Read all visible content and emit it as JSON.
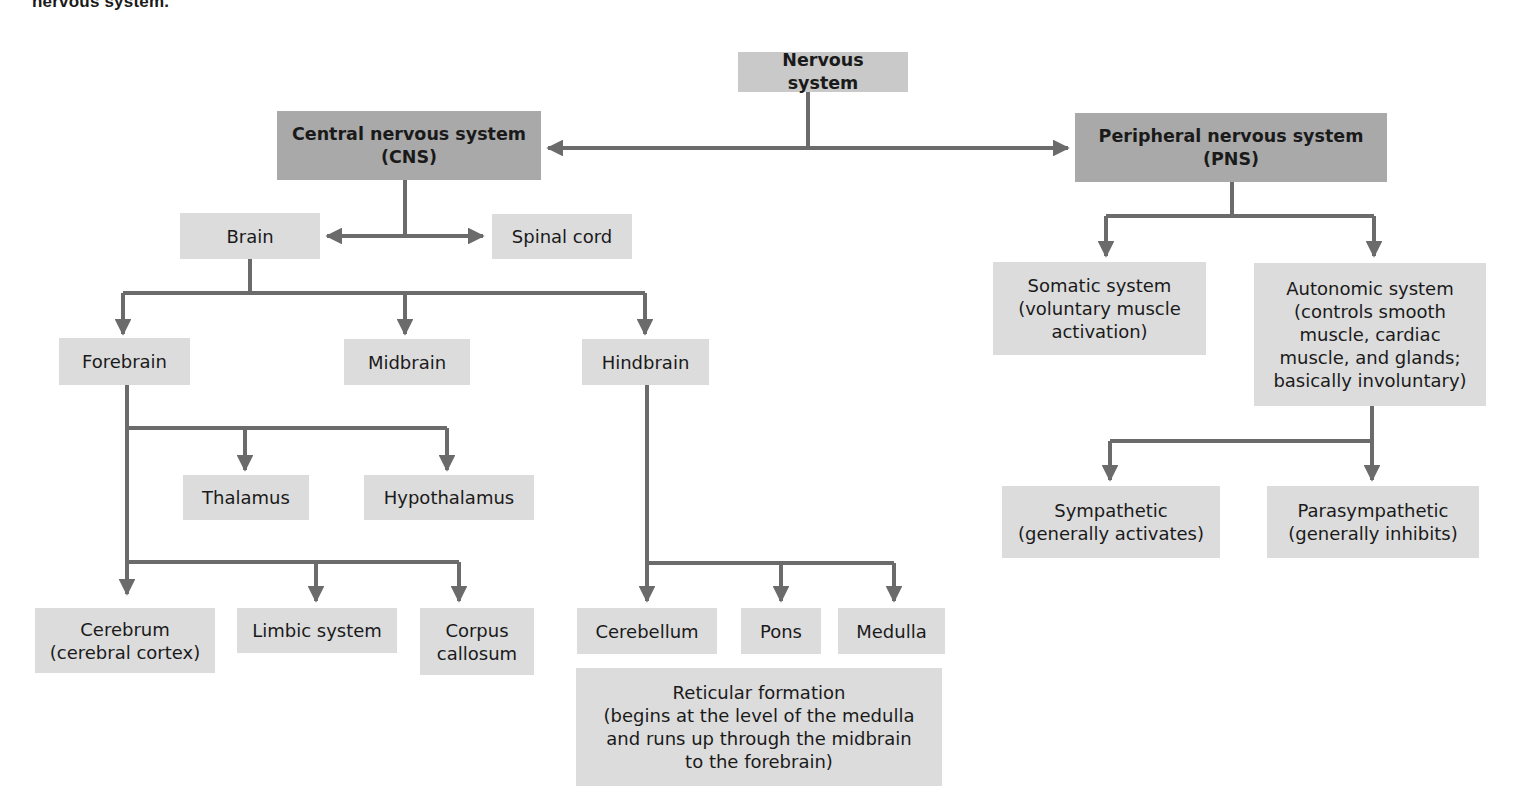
{
  "caption": "nervous system.",
  "colors": {
    "top_level_box": "#c9c9c9",
    "division_box": "#a9a9a9",
    "leaf_box": "#dcdcdc",
    "connector": "#6b6b6b"
  },
  "nodes": {
    "nervous_system": "Nervous system",
    "cns": "Central nervous system\n(CNS)",
    "pns": "Peripheral nervous system\n(PNS)",
    "brain": "Brain",
    "spinal_cord": "Spinal cord",
    "forebrain": "Forebrain",
    "midbrain": "Midbrain",
    "hindbrain": "Hindbrain",
    "thalamus": "Thalamus",
    "hypothalamus": "Hypothalamus",
    "cerebrum": "Cerebrum\n(cerebral cortex)",
    "limbic_system": "Limbic system",
    "corpus_callosum": "Corpus\ncallosum",
    "cerebellum": "Cerebellum",
    "pons": "Pons",
    "medulla": "Medulla",
    "reticular_formation": "Reticular formation\n(begins at the level of the medulla\nand runs up through the midbrain\nto the forebrain)",
    "somatic": "Somatic system\n(voluntary muscle\nactivation)",
    "autonomic": "Autonomic system\n(controls smooth\nmuscle, cardiac\nmuscle, and glands;\nbasically involuntary)",
    "sympathetic": "Sympathetic\n(generally activates)",
    "parasympathetic": "Parasympathetic\n(generally inhibits)"
  },
  "edges": [
    [
      "nervous_system",
      "cns"
    ],
    [
      "nervous_system",
      "pns"
    ],
    [
      "cns",
      "brain"
    ],
    [
      "cns",
      "spinal_cord"
    ],
    [
      "brain",
      "forebrain"
    ],
    [
      "brain",
      "midbrain"
    ],
    [
      "brain",
      "hindbrain"
    ],
    [
      "forebrain",
      "thalamus"
    ],
    [
      "forebrain",
      "hypothalamus"
    ],
    [
      "forebrain",
      "cerebrum"
    ],
    [
      "forebrain",
      "limbic_system"
    ],
    [
      "forebrain",
      "corpus_callosum"
    ],
    [
      "hindbrain",
      "cerebellum"
    ],
    [
      "hindbrain",
      "pons"
    ],
    [
      "hindbrain",
      "medulla"
    ],
    [
      "pns",
      "somatic"
    ],
    [
      "pns",
      "autonomic"
    ],
    [
      "autonomic",
      "sympathetic"
    ],
    [
      "autonomic",
      "parasympathetic"
    ]
  ]
}
